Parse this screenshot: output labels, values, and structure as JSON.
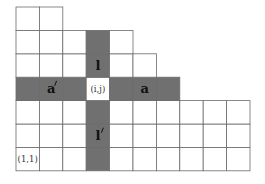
{
  "diagram": {
    "notation": "French",
    "row_lengths_bottom_to_top": [
      10,
      10,
      10,
      7,
      6,
      5,
      2
    ],
    "highlight_cell": {
      "row": 4,
      "col": 4,
      "label": "(i,j)"
    },
    "shaded_color": "#707070",
    "cell_fill": "#ffffff",
    "highlight_fill": "#ffffff",
    "labels": [
      {
        "id": "arm",
        "text": "a",
        "row": 4,
        "col": 6,
        "bold": true,
        "prime": false
      },
      {
        "id": "coarm",
        "text": "a",
        "row": 4,
        "col": 2,
        "bold": true,
        "prime": true
      },
      {
        "id": "leg",
        "text": "l",
        "row": 5,
        "col": 4,
        "bold": true,
        "prime": false
      },
      {
        "id": "coleg",
        "text": "l",
        "row": 2,
        "col": 4,
        "bold": true,
        "prime": true
      },
      {
        "id": "cell-ij",
        "text": "(i,j)",
        "row": 4,
        "col": 4,
        "bold": false,
        "prime": false
      },
      {
        "id": "origin",
        "text": "(1,1)",
        "row": 1,
        "col": 1,
        "bold": false,
        "prime": false
      }
    ]
  }
}
